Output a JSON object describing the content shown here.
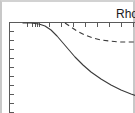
{
  "figure": {
    "label": "Rho",
    "background_color": "#ffffff",
    "frame_color": "#c8c8c8",
    "axis_color": "#5a5a5a"
  },
  "chart_data": {
    "type": "line",
    "title": "Rho",
    "subtitle": "",
    "xlabel": "",
    "ylabel": "",
    "xlim": [
      0,
      128
    ],
    "ylim": [
      0,
      93
    ],
    "grid": false,
    "legend": "top-right",
    "axes_visible": [
      "top",
      "left"
    ],
    "x_tick_positions": [
      18,
      23,
      26,
      28,
      30,
      40,
      52,
      64,
      76,
      88,
      100,
      112,
      124
    ],
    "y_tick_positions": [
      22,
      31,
      40,
      49,
      58,
      67,
      76,
      85,
      94,
      103
    ],
    "series": [
      {
        "name": "solid-curve",
        "style": "solid",
        "color": "#3a3a3a",
        "x": [
          14,
          22,
          30,
          36,
          42,
          48,
          54,
          60,
          66,
          74,
          82,
          92,
          102,
          112,
          122,
          128
        ],
        "y": [
          14,
          14,
          15,
          17,
          21,
          27,
          34,
          41,
          48,
          56,
          63,
          70,
          76,
          81,
          85,
          87
        ]
      },
      {
        "name": "dashed-curve",
        "style": "dashed",
        "color": "#3a3a3a",
        "x": [
          56,
          62,
          68,
          76,
          84,
          92,
          100,
          110,
          120,
          128
        ],
        "y": [
          14,
          18,
          22,
          26,
          29,
          31,
          32,
          33,
          33,
          33
        ]
      }
    ]
  }
}
